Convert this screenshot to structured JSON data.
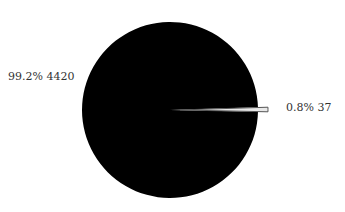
{
  "chart_data": {
    "type": "pie",
    "title": "",
    "title_clipped": true,
    "slices": [
      {
        "label": "99.2%  4420",
        "percent": 99.2,
        "value": 4420,
        "color": "#000000"
      },
      {
        "label": "0.8%  37",
        "percent": 0.8,
        "value": 37,
        "color": "#e8e8e8",
        "stroke": "#555555"
      }
    ],
    "total": 4457,
    "legend": "none"
  }
}
